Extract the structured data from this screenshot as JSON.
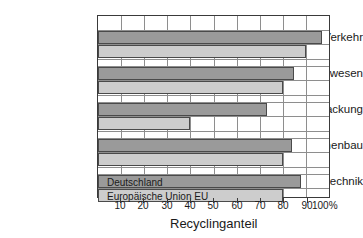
{
  "chart_data": {
    "type": "bar",
    "orientation": "horizontal",
    "title": "",
    "xlabel": "Recyclinganteil",
    "ylabel": "",
    "xlim": [
      0,
      100
    ],
    "xticks": [
      10,
      20,
      30,
      40,
      50,
      60,
      70,
      80,
      90,
      100
    ],
    "xtick_labels": [
      "10",
      "20",
      "30",
      "40",
      "50",
      "60",
      "70",
      "80",
      "90",
      "100%"
    ],
    "grid": true,
    "legend_position": "inside-bottom-bars",
    "categories": [
      "Verkehr",
      "Bauwesen",
      "Verpackung",
      "Maschinenbau",
      "Elektrotechnik"
    ],
    "series": [
      {
        "name": "Deutschland",
        "color": "#9a9a9a",
        "values": [
          97,
          85,
          73,
          84,
          88
        ]
      },
      {
        "name": "Europäische Union EU",
        "color": "#cdcdcd",
        "values": [
          90,
          80,
          40,
          80,
          80
        ]
      }
    ]
  },
  "axis": {
    "x_title": "Recyclinganteil",
    "ticks": [
      "10",
      "20",
      "30",
      "40",
      "50",
      "60",
      "70",
      "80",
      "90",
      "100%"
    ]
  },
  "categories": [
    {
      "label": "Verkehr"
    },
    {
      "label": "Bauwesen"
    },
    {
      "label": "Verpackung"
    },
    {
      "label": "Maschinenbau"
    },
    {
      "label": "Elektrotechnik"
    }
  ],
  "legend": {
    "deutschland": "Deutschland",
    "eu": "Europäische Union EU"
  },
  "colors": {
    "series_deutschland": "#9a9a9a",
    "series_eu": "#cdcdcd",
    "axis": "#3a3a3a",
    "grid": "#8e8e8e",
    "background": "#ffffff"
  }
}
